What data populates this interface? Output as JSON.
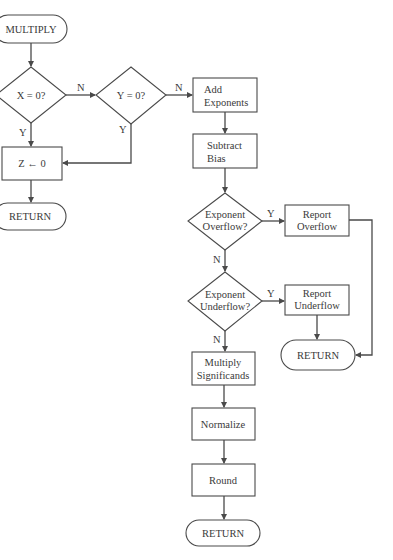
{
  "diagram": {
    "type": "flowchart",
    "colors": {
      "stroke": "#4a4a4a",
      "text": "#3a3a3a",
      "background": "#ffffff"
    },
    "nodes": {
      "start": {
        "kind": "terminator",
        "label": "MULTIPLY"
      },
      "x_zero": {
        "kind": "decision",
        "label": "X = 0?"
      },
      "y_zero": {
        "kind": "decision",
        "label": "Y = 0?"
      },
      "z_zero": {
        "kind": "process",
        "label": "Z ← 0"
      },
      "return_zero": {
        "kind": "terminator",
        "label": "RETURN"
      },
      "add_exp": {
        "kind": "process",
        "line1": "Add",
        "line2": "Exponents"
      },
      "sub_bias": {
        "kind": "process",
        "line1": "Subtract",
        "line2": "Bias"
      },
      "exp_overflow": {
        "kind": "decision",
        "line1": "Exponent",
        "line2": "Overflow?"
      },
      "report_overflow": {
        "kind": "process",
        "line1": "Report",
        "line2": "Overflow"
      },
      "exp_underflow": {
        "kind": "decision",
        "line1": "Exponent",
        "line2": "Underflow?"
      },
      "report_underflow": {
        "kind": "process",
        "line1": "Report",
        "line2": "Underflow"
      },
      "return_error": {
        "kind": "terminator",
        "label": "RETURN"
      },
      "mult_sig": {
        "kind": "process",
        "line1": "Multiply",
        "line2": "Significands"
      },
      "normalize": {
        "kind": "process",
        "label": "Normalize"
      },
      "round": {
        "kind": "process",
        "label": "Round"
      },
      "return_end": {
        "kind": "terminator",
        "label": "RETURN"
      }
    },
    "edges": {
      "x_zero_no": "N",
      "x_zero_yes": "Y",
      "y_zero_no": "N",
      "y_zero_yes": "Y",
      "overflow_yes": "Y",
      "overflow_no": "N",
      "underflow_yes": "Y",
      "underflow_no": "N"
    },
    "connections": [
      [
        "start",
        "x_zero"
      ],
      [
        "x_zero",
        "y_zero",
        "N"
      ],
      [
        "x_zero",
        "z_zero",
        "Y"
      ],
      [
        "y_zero",
        "add_exp",
        "N"
      ],
      [
        "y_zero",
        "z_zero",
        "Y"
      ],
      [
        "z_zero",
        "return_zero"
      ],
      [
        "add_exp",
        "sub_bias"
      ],
      [
        "sub_bias",
        "exp_overflow"
      ],
      [
        "exp_overflow",
        "report_overflow",
        "Y"
      ],
      [
        "exp_overflow",
        "exp_underflow",
        "N"
      ],
      [
        "exp_underflow",
        "report_underflow",
        "Y"
      ],
      [
        "exp_underflow",
        "mult_sig",
        "N"
      ],
      [
        "report_overflow",
        "return_error"
      ],
      [
        "report_underflow",
        "return_error"
      ],
      [
        "mult_sig",
        "normalize"
      ],
      [
        "normalize",
        "round"
      ],
      [
        "round",
        "return_end"
      ]
    ]
  }
}
